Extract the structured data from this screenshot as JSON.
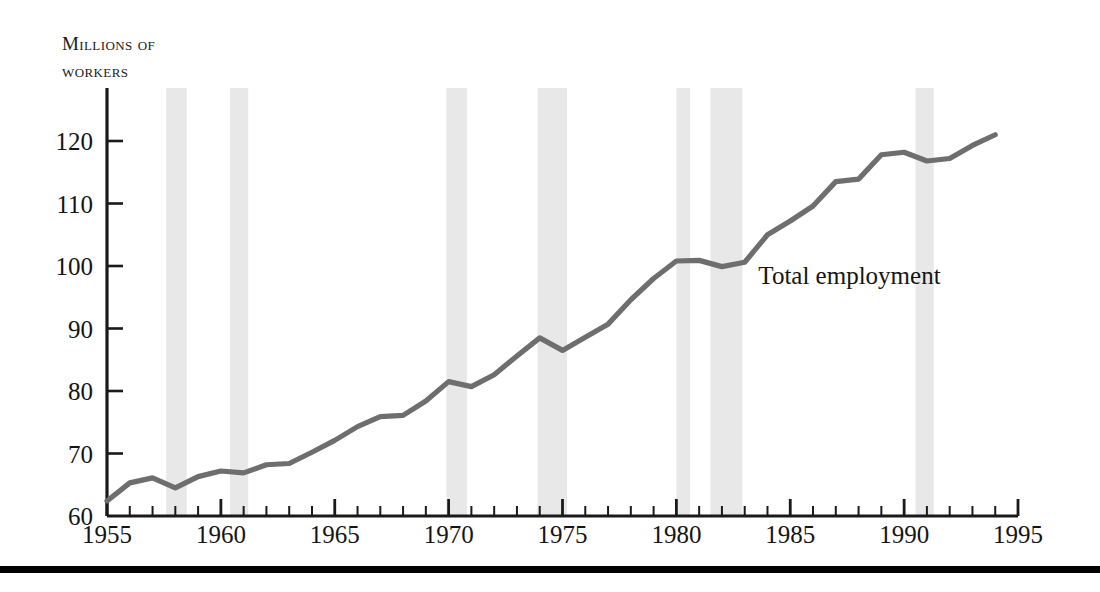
{
  "chart_data": {
    "type": "line",
    "title": "",
    "ylabel": "Millions of workers",
    "ylabel_lines": [
      "Millions of",
      "workers"
    ],
    "xlabel": "",
    "xlim": [
      1955,
      1995
    ],
    "ylim": [
      60,
      126
    ],
    "ytick_values": [
      60,
      70,
      80,
      90,
      100,
      110,
      120
    ],
    "ytick_labels": [
      "60",
      "70",
      "80",
      "90",
      "100",
      "110",
      "120"
    ],
    "xtick_values": [
      1955,
      1960,
      1965,
      1970,
      1975,
      1980,
      1985,
      1990,
      1995
    ],
    "xtick_labels": [
      "1955",
      "1960",
      "1965",
      "1970",
      "1975",
      "1980",
      "1985",
      "1990",
      "1995"
    ],
    "minor_xtick_interval": 1,
    "grid": false,
    "legend_position": "inline-annotation",
    "series": [
      {
        "name": "Total employment",
        "color": "#6e6e6e",
        "annotation": "Total employment",
        "annotation_x": 1983.6,
        "annotation_y": 97.2,
        "x": [
          1955,
          1956,
          1957,
          1958,
          1959,
          1960,
          1961,
          1962,
          1963,
          1964,
          1965,
          1966,
          1967,
          1968,
          1969,
          1970,
          1971,
          1972,
          1973,
          1974,
          1975,
          1976,
          1977,
          1978,
          1979,
          1980,
          1981,
          1982,
          1983,
          1984,
          1985,
          1986,
          1987,
          1988,
          1989,
          1990,
          1991,
          1992,
          1993,
          1994
        ],
        "y": [
          62.4,
          65.3,
          66.1,
          64.5,
          66.3,
          67.2,
          66.9,
          68.2,
          68.4,
          70.2,
          72.1,
          74.3,
          75.9,
          76.1,
          78.4,
          81.5,
          80.7,
          82.6,
          85.6,
          88.5,
          86.5,
          88.6,
          90.7,
          94.6,
          98.0,
          100.8,
          100.9,
          99.9,
          100.6,
          105.0,
          107.2,
          109.6,
          113.5,
          113.9,
          117.8,
          118.2,
          116.8,
          117.2,
          119.3,
          121.0
        ]
      }
    ],
    "recession_bands": [
      {
        "start": 1957.6,
        "end": 1958.5
      },
      {
        "start": 1960.4,
        "end": 1961.2
      },
      {
        "start": 1969.9,
        "end": 1970.8
      },
      {
        "start": 1973.9,
        "end": 1975.2
      },
      {
        "start": 1980.0,
        "end": 1980.6
      },
      {
        "start": 1981.5,
        "end": 1982.9
      },
      {
        "start": 1990.5,
        "end": 1991.3
      }
    ],
    "band_color": "#e8e8e8",
    "axis_color": "#1a1a1a"
  }
}
